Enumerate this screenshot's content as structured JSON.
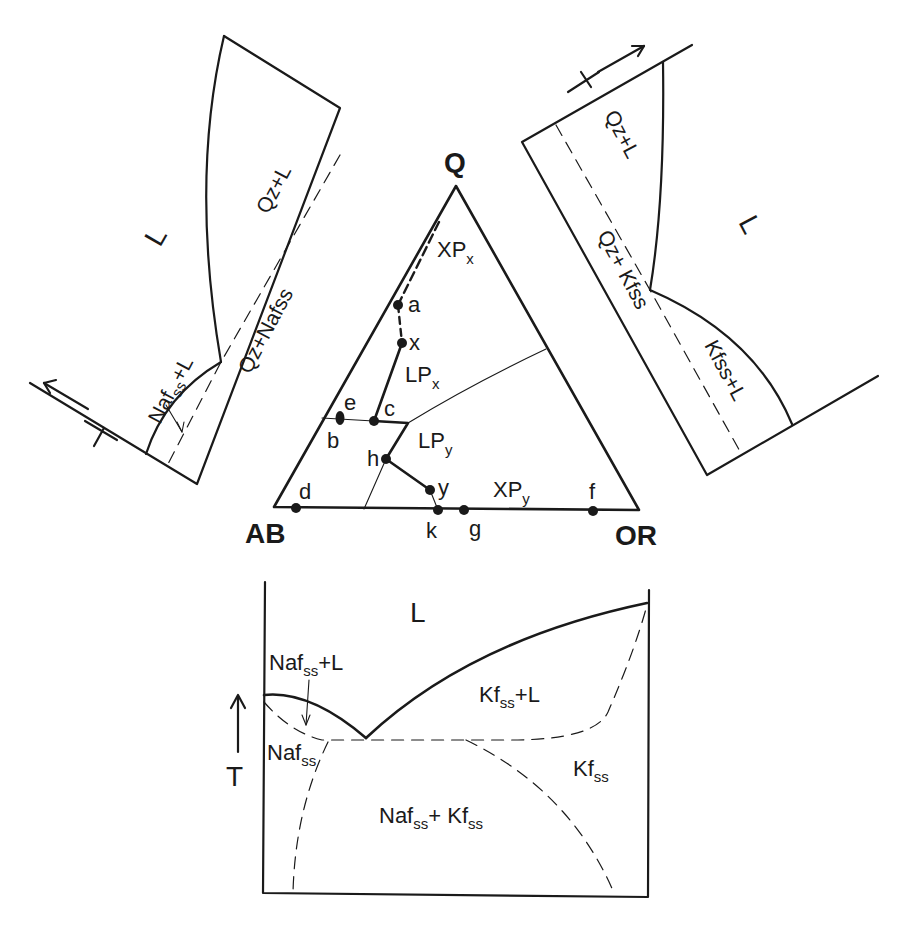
{
  "figure": {
    "type": "phase-diagram"
  },
  "ternary": {
    "apices": {
      "top": "Q",
      "left": "AB",
      "right": "OR"
    },
    "fields": {
      "xpx": {
        "main": "XP",
        "sub": "x"
      },
      "lpx": {
        "main": "LP",
        "sub": "x"
      },
      "lpy": {
        "main": "LP",
        "sub": "y"
      },
      "xpy": {
        "main": "XP",
        "sub": "y"
      }
    },
    "points": {
      "a": "a",
      "x": "x",
      "c": "c",
      "e": "e",
      "b": "b",
      "h": "h",
      "y": "y",
      "d": "d",
      "k": "k",
      "g": "g",
      "f": "f"
    }
  },
  "left_section": {
    "liquid": "L",
    "fields": {
      "qz_l": "Qz+L",
      "qz_naf": "Qz+Nafss",
      "naf_l": {
        "main": "Naf",
        "sub": "ss",
        "tail": "+L"
      }
    },
    "axis": {
      "label": "T",
      "arrow": "up-left"
    }
  },
  "right_section": {
    "liquid": "L",
    "fields": {
      "qz_l": "Qz+L",
      "qz_kf": "Qz+ Kfss",
      "kf_l": "Kfss+L"
    },
    "axis": {
      "label": "T",
      "arrow": "up-right"
    }
  },
  "binary": {
    "liquid": "L",
    "axis": {
      "label": "T",
      "arrow": "up"
    },
    "fields": {
      "naf_l": {
        "main": "Naf",
        "sub": "ss",
        "tail": "+L"
      },
      "naf": {
        "main": "Naf",
        "sub": "ss"
      },
      "kf_l": {
        "main": "Kf",
        "sub": "ss",
        "tail": "+L"
      },
      "kf": {
        "main": "Kf",
        "sub": "ss"
      },
      "naf_kf": {
        "main1": "Naf",
        "sub1": "ss",
        "mid": "+ Kf",
        "sub2": "ss"
      }
    }
  }
}
